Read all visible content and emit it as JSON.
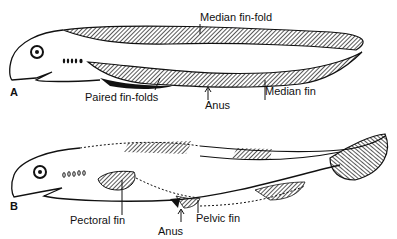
{
  "figure": {
    "panel_a": {
      "letter": "A",
      "labels": {
        "median_fin_fold": "Median fin-fold",
        "paired_fin_folds": "Paired fin-folds",
        "anus": "Anus",
        "median_fin": "Median fin"
      }
    },
    "panel_b": {
      "letter": "B",
      "labels": {
        "pectoral_fin": "Pectoral fin",
        "anus": "Anus",
        "pelvic_fin": "Pelvic fin"
      }
    }
  }
}
